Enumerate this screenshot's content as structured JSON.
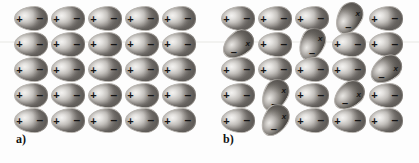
{
  "figure": {
    "background_color": "#fdfdfd",
    "width": 419,
    "height": 163
  },
  "symbols": {
    "plus": "+",
    "minus": "–",
    "cross": "x"
  },
  "panels": [
    {
      "id": "a",
      "label": "a)",
      "rows": 5,
      "cols": 5,
      "caption_note": "all dipoles aligned in plane",
      "cells": [
        [
          {
            "state": "aligned",
            "rotation": 0
          },
          {
            "state": "aligned",
            "rotation": 0
          },
          {
            "state": "aligned",
            "rotation": 0
          },
          {
            "state": "aligned",
            "rotation": 0
          },
          {
            "state": "aligned",
            "rotation": 0
          }
        ],
        [
          {
            "state": "aligned",
            "rotation": 0
          },
          {
            "state": "aligned",
            "rotation": 0
          },
          {
            "state": "aligned",
            "rotation": 0
          },
          {
            "state": "aligned",
            "rotation": 0
          },
          {
            "state": "aligned",
            "rotation": 0
          }
        ],
        [
          {
            "state": "aligned",
            "rotation": 0
          },
          {
            "state": "aligned",
            "rotation": 0
          },
          {
            "state": "aligned",
            "rotation": 0
          },
          {
            "state": "aligned",
            "rotation": 0
          },
          {
            "state": "aligned",
            "rotation": 0
          }
        ],
        [
          {
            "state": "aligned",
            "rotation": 0
          },
          {
            "state": "aligned",
            "rotation": 0
          },
          {
            "state": "aligned",
            "rotation": 0
          },
          {
            "state": "aligned",
            "rotation": 0
          },
          {
            "state": "aligned",
            "rotation": 0
          }
        ],
        [
          {
            "state": "aligned",
            "rotation": 0
          },
          {
            "state": "aligned",
            "rotation": 0
          },
          {
            "state": "aligned",
            "rotation": 0
          },
          {
            "state": "aligned",
            "rotation": 0
          },
          {
            "state": "aligned",
            "rotation": 0
          }
        ]
      ]
    },
    {
      "id": "b",
      "label": "b)",
      "rows": 5,
      "cols": 5,
      "caption_note": "seven dipoles rotated out of alignment, marked with a cross",
      "flipped_count": 7,
      "cells": [
        [
          {
            "state": "aligned",
            "rotation": 0
          },
          {
            "state": "aligned",
            "rotation": 0
          },
          {
            "state": "aligned",
            "rotation": 0
          },
          {
            "state": "flipped",
            "rotation": -62
          },
          {
            "state": "aligned",
            "rotation": 0
          }
        ],
        [
          {
            "state": "flipped",
            "rotation": -38
          },
          {
            "state": "aligned",
            "rotation": 0
          },
          {
            "state": "flipped",
            "rotation": -66
          },
          {
            "state": "aligned",
            "rotation": 0
          },
          {
            "state": "aligned",
            "rotation": 0
          }
        ],
        [
          {
            "state": "aligned",
            "rotation": 0
          },
          {
            "state": "aligned",
            "rotation": 0
          },
          {
            "state": "aligned",
            "rotation": 0
          },
          {
            "state": "aligned",
            "rotation": 0
          },
          {
            "state": "flipped",
            "rotation": -36
          }
        ],
        [
          {
            "state": "aligned",
            "rotation": 0
          },
          {
            "state": "flipped",
            "rotation": -62
          },
          {
            "state": "aligned",
            "rotation": 0
          },
          {
            "state": "flipped",
            "rotation": -40
          },
          {
            "state": "aligned",
            "rotation": 0
          }
        ],
        [
          {
            "state": "aligned",
            "rotation": 0
          },
          {
            "state": "flipped",
            "rotation": -58
          },
          {
            "state": "aligned",
            "rotation": 0
          },
          {
            "state": "aligned",
            "rotation": 0
          },
          {
            "state": "aligned",
            "rotation": 0
          }
        ]
      ]
    }
  ]
}
